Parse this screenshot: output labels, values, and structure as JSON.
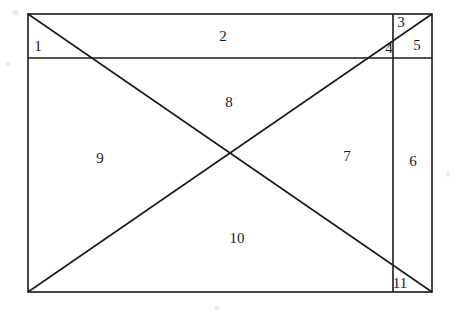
{
  "figure": {
    "stroke_color": "#1a1a1a",
    "background_color": "#ffffff",
    "label_color": "#1a1a1a",
    "rectangle": {
      "left": 28,
      "top": 14,
      "right": 432,
      "bottom": 292
    },
    "lines": {
      "horizontal_y": 58,
      "vertical_x": 393,
      "diagonal_down": "from (28,14) to (432,292)",
      "diagonal_up": "from (28,292) to (432,14)",
      "diagonals_intersection": "(230,153)"
    },
    "regions": [
      {
        "id": "region-1",
        "label": "1",
        "x": 38,
        "y": 46
      },
      {
        "id": "region-2",
        "label": "2",
        "x": 223,
        "y": 36
      },
      {
        "id": "region-3",
        "label": "3",
        "x": 401,
        "y": 22
      },
      {
        "id": "region-4",
        "label": "4",
        "x": 389,
        "y": 48
      },
      {
        "id": "region-5",
        "label": "5",
        "x": 417,
        "y": 45
      },
      {
        "id": "region-6",
        "label": "6",
        "x": 413,
        "y": 161
      },
      {
        "id": "region-7",
        "label": "7",
        "x": 347,
        "y": 156
      },
      {
        "id": "region-8",
        "label": "8",
        "x": 229,
        "y": 102
      },
      {
        "id": "region-9",
        "label": "9",
        "x": 100,
        "y": 158
      },
      {
        "id": "region-10",
        "label": "10",
        "x": 237,
        "y": 238
      },
      {
        "id": "region-11",
        "label": "11",
        "x": 400,
        "y": 283
      }
    ]
  }
}
